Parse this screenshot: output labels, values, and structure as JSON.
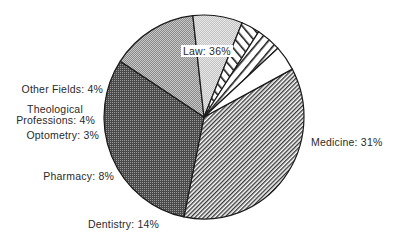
{
  "chart_data": {
    "type": "pie",
    "title": "",
    "start_angle_deg": -28,
    "direction": "clockwise",
    "slices": [
      {
        "label": "Law",
        "value": 36,
        "display": "Law: 36%",
        "pattern": "diag-fine"
      },
      {
        "label": "Medicine",
        "value": 31,
        "display": "Medicine: 31%",
        "pattern": "dots-dark"
      },
      {
        "label": "Dentistry",
        "value": 14,
        "display": "Dentistry: 14%",
        "pattern": "dots-medium"
      },
      {
        "label": "Pharmacy",
        "value": 8,
        "display": "Pharmacy: 8%",
        "pattern": "dots-light"
      },
      {
        "label": "Optometry",
        "value": 3,
        "display": "Optometry: 3%",
        "pattern": "diag-wide-right"
      },
      {
        "label": "Theological Professions",
        "value": 4,
        "display": "Theological Professions: 4%",
        "pattern": "diag-wide-left"
      },
      {
        "label": "Other Fields",
        "value": 4,
        "display": "Other Fields: 4%",
        "pattern": "white"
      }
    ],
    "categories": [
      "Law",
      "Medicine",
      "Dentistry",
      "Pharmacy",
      "Optometry",
      "Theological Professions",
      "Other Fields"
    ],
    "values": [
      36,
      31,
      14,
      8,
      3,
      4,
      4
    ],
    "unit": "%"
  },
  "labels": {
    "law": "Law: 36%",
    "medicine": "Medicine: 31%",
    "dentistry": "Dentistry: 14%",
    "pharmacy": "Pharmacy: 8%",
    "optometry": "Optometry: 3%",
    "theological_line1": "Theological",
    "theological_line2": "Professions: 4%",
    "other": "Other Fields: 4%"
  },
  "colors": {
    "outline": "#1a1a1a",
    "ink": "#2a2a2a",
    "background": "#ffffff"
  }
}
